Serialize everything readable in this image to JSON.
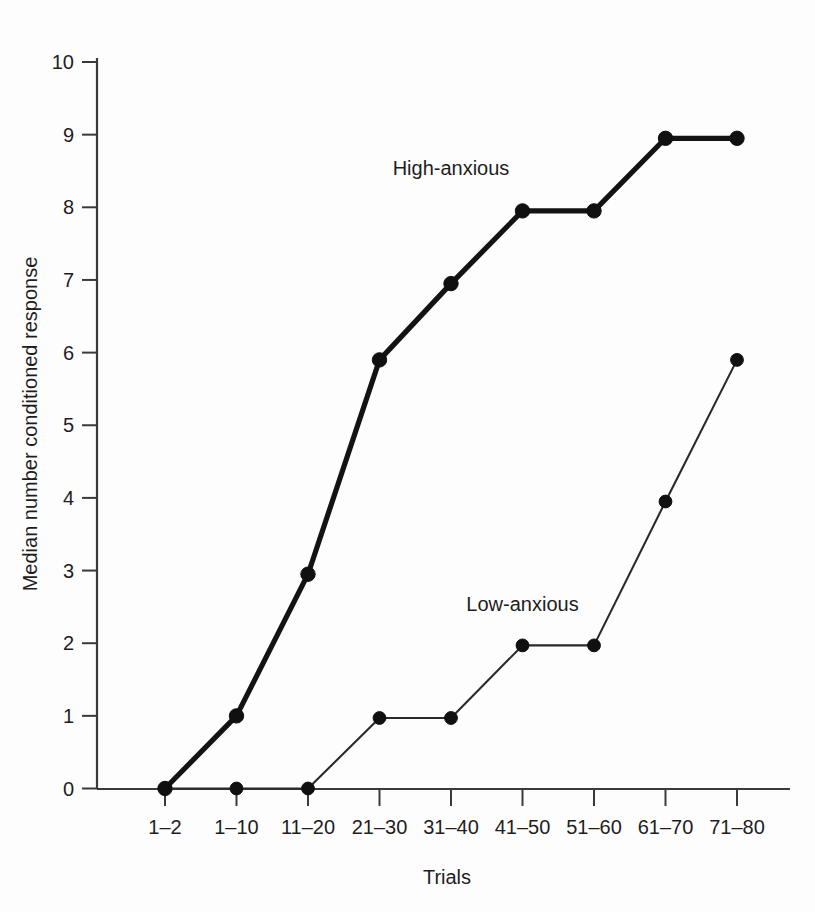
{
  "chart_data": {
    "type": "line",
    "title": "",
    "xlabel": "Trials",
    "ylabel": "Median number conditioned response",
    "categories": [
      "1–2",
      "1–10",
      "11–20",
      "21–30",
      "31–40",
      "41–50",
      "51–60",
      "61–70",
      "71–80"
    ],
    "ylim": [
      0,
      10
    ],
    "yticks": [
      "0",
      "1",
      "2",
      "3",
      "4",
      "5",
      "6",
      "7",
      "8",
      "9",
      "10"
    ],
    "grid": false,
    "legend_position": "inline-annotation",
    "series": [
      {
        "name": "High-anxious",
        "values": [
          0,
          1,
          2.95,
          5.9,
          6.95,
          7.95,
          7.95,
          8.95,
          8.95
        ],
        "line_style": "thick",
        "color": "#101010",
        "label_x_category": "31–40",
        "label_value": 8.45
      },
      {
        "name": "Low-anxious",
        "values": [
          0,
          0,
          0,
          0.97,
          0.97,
          1.97,
          1.97,
          3.95,
          5.9
        ],
        "line_style": "thin",
        "color": "#2a2a2a",
        "label_x_category": "41–50",
        "label_value": 2.45
      }
    ]
  },
  "axes": {
    "y_axis_title": "Median number conditioned response",
    "x_axis_title": "Trials",
    "y_tick_labels": [
      "10",
      "9",
      "8",
      "7",
      "6",
      "5",
      "4",
      "3",
      "2",
      "1",
      "0"
    ],
    "x_tick_labels": [
      "1–2",
      "1–10",
      "11–20",
      "21–30",
      "31–40",
      "41–50",
      "51–60",
      "61–70",
      "71–80"
    ]
  },
  "annotations": {
    "high_anxious_label": "High-anxious",
    "low_anxious_label": "Low-anxious"
  },
  "colors": {
    "background": "#fdfdfd",
    "axis": "#3a3a3a",
    "high_anxious": "#101010",
    "low_anxious": "#2a2a2a",
    "text": "#1d1d1d"
  }
}
